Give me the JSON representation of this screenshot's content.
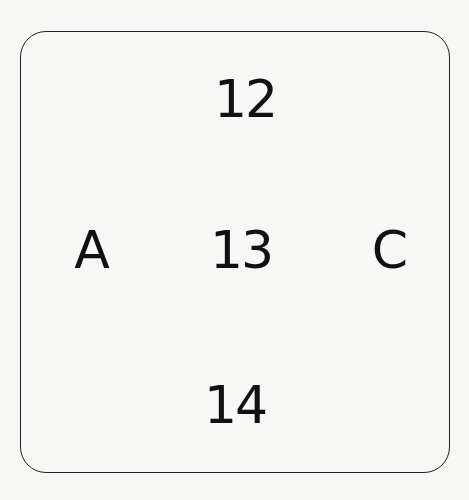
{
  "diagram": {
    "labels": {
      "top": "12",
      "left": "A",
      "center": "13",
      "right": "C",
      "bottom": "14"
    }
  }
}
